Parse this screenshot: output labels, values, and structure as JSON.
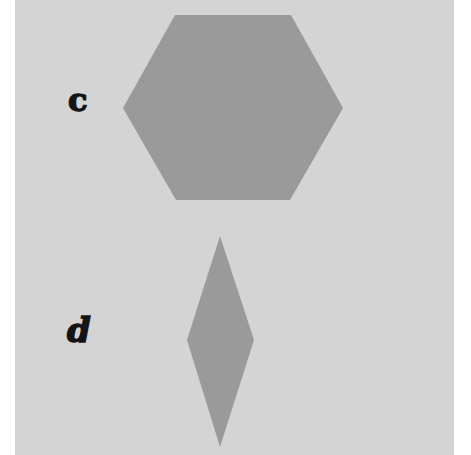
{
  "figure": {
    "background_color": "#d4d4d4",
    "margin_color": "#ffffff",
    "shape_fill": "#9a9a9a",
    "label_color": "#141414",
    "items": [
      {
        "label": "c",
        "shape": "hexagon",
        "points": "175,15 291,15 343,108 290,200 176,200 123,108"
      },
      {
        "label": "d",
        "shape": "rhombus",
        "points": "220,236 254,340 220,447 187,340"
      }
    ]
  }
}
